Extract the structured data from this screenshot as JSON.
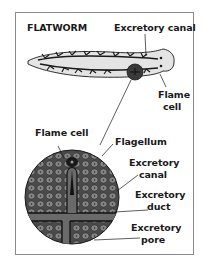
{
  "diagram": {
    "title": "FLATWORM",
    "labels": {
      "excretory_canal_top": "Excretory canal",
      "flame_cell_top_line1": "Flame",
      "flame_cell_top_line2": "cell",
      "flame_cell_detail": "Flame cell",
      "flagellum": "Flagellum",
      "excretory_canal_detail_line1": "Excretory",
      "excretory_canal_detail_line2": "canal",
      "excretory_duct_line1": "Excretory",
      "excretory_duct_line2": "duct",
      "excretory_pore_line1": "Excretory",
      "excretory_pore_line2": "pore"
    },
    "colors": {
      "ink": "#1a1a1a",
      "body_fill": "#e4e4e4",
      "circle_fill": "#5a5a5a",
      "cell_fill": "#7a7a7a",
      "frame": "#8a8a8a"
    }
  }
}
